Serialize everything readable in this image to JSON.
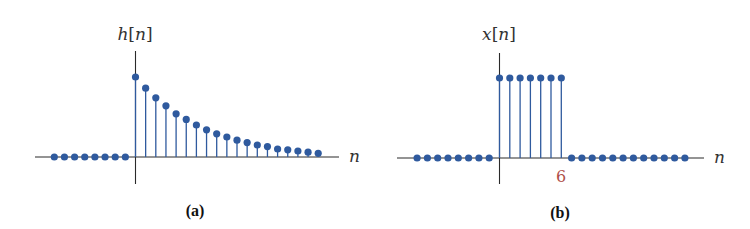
{
  "figure": {
    "panels": [
      {
        "id": "a",
        "caption": "(a)",
        "ylabel": {
          "fn": "h",
          "open": "[",
          "var": "n",
          "close": "]"
        },
        "xlabel": "n",
        "tick_labels": []
      },
      {
        "id": "b",
        "caption": "(b)",
        "ylabel": {
          "fn": "x",
          "open": "[",
          "var": "n",
          "close": "]"
        },
        "xlabel": "n",
        "tick_labels": [
          {
            "n": 6,
            "text": "6"
          }
        ]
      }
    ],
    "colors": {
      "stem": "#2f5a9e",
      "axis": "#2a2a2a",
      "tick_label": "#b0504a"
    }
  },
  "chart_data": [
    {
      "type": "stem",
      "title": "(a)",
      "ylabel": "h[n]",
      "xlabel": "n",
      "x": [
        -8,
        -7,
        -6,
        -5,
        -4,
        -3,
        -2,
        -1,
        0,
        1,
        2,
        3,
        4,
        5,
        6,
        7,
        8,
        9,
        10,
        11,
        12,
        13,
        14,
        15,
        16,
        17,
        18
      ],
      "values": [
        0,
        0,
        0,
        0,
        0,
        0,
        0,
        0,
        1.0,
        0.86,
        0.74,
        0.64,
        0.54,
        0.47,
        0.4,
        0.34,
        0.29,
        0.25,
        0.21,
        0.18,
        0.15,
        0.13,
        0.1,
        0.09,
        0.075,
        0.06,
        0.046
      ],
      "tick_labels": [],
      "grid": false
    },
    {
      "type": "stem",
      "title": "(b)",
      "ylabel": "x[n]",
      "xlabel": "n",
      "x": [
        -8,
        -7,
        -6,
        -5,
        -4,
        -3,
        -2,
        -1,
        0,
        1,
        2,
        3,
        4,
        5,
        6,
        7,
        8,
        9,
        10,
        11,
        12,
        13,
        14,
        15,
        16,
        17,
        18
      ],
      "values": [
        0,
        0,
        0,
        0,
        0,
        0,
        0,
        0,
        1,
        1,
        1,
        1,
        1,
        1,
        1,
        0,
        0,
        0,
        0,
        0,
        0,
        0,
        0,
        0,
        0,
        0,
        0
      ],
      "tick_labels": [
        "6"
      ],
      "grid": false
    }
  ]
}
